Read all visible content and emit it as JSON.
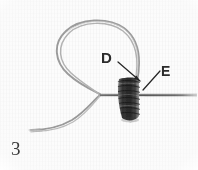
{
  "figure": {
    "number": "3",
    "kind": "photograph",
    "background_color": "#fdfdfd",
    "ink_color": "#3a3a3a",
    "knot_color": "#2f2f2f",
    "thread_color": "#8a8a8a",
    "leader_color": "#262626",
    "label_color": "#2b2b2b"
  },
  "labels": [
    {
      "id": "D",
      "text": "D",
      "x": 101,
      "y": 50,
      "leader_from": [
        118,
        62
      ],
      "leader_to": [
        140,
        81
      ]
    },
    {
      "id": "E",
      "text": "E",
      "x": 161,
      "y": 64,
      "leader_from": [
        160,
        70
      ],
      "leader_to": [
        143,
        90
      ]
    }
  ],
  "elements": {
    "loop_label": "thread loop",
    "knot_label": "coiled knot wrap",
    "standing_line_label": "standing thread / needle shaft",
    "tail_label": "free thread tail"
  }
}
